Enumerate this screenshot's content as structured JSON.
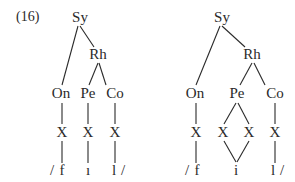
{
  "example_number": "(16)",
  "trees": [
    {
      "id": "left",
      "nodes": {
        "sy": {
          "label": "Sy",
          "x": 80,
          "y": 22
        },
        "rh": {
          "label": "Rh",
          "x": 98,
          "y": 59
        },
        "on": {
          "label": "On",
          "x": 61,
          "y": 98
        },
        "pe": {
          "label": "Pe",
          "x": 88,
          "y": 98
        },
        "co": {
          "label": "Co",
          "x": 115,
          "y": 98
        },
        "x1": {
          "label": "X",
          "x": 62,
          "y": 137
        },
        "x2": {
          "label": "X",
          "x": 88,
          "y": 137
        },
        "x3": {
          "label": "X",
          "x": 115,
          "y": 137
        }
      },
      "segments": {
        "open_slash": {
          "label": "/",
          "x": 52,
          "y": 175
        },
        "f": {
          "label": "f",
          "x": 62,
          "y": 175
        },
        "i": {
          "label": "ı",
          "x": 88,
          "y": 175
        },
        "l": {
          "label": "l",
          "x": 114,
          "y": 175
        },
        "close_slash": {
          "label": "/",
          "x": 123,
          "y": 175
        }
      }
    },
    {
      "id": "right",
      "nodes": {
        "sy": {
          "label": "Sy",
          "x": 222,
          "y": 22
        },
        "rh": {
          "label": "Rh",
          "x": 252,
          "y": 59
        },
        "on": {
          "label": "On",
          "x": 195,
          "y": 98
        },
        "pe": {
          "label": "Pe",
          "x": 237,
          "y": 98
        },
        "co": {
          "label": "Co",
          "x": 275,
          "y": 98
        },
        "x1": {
          "label": "X",
          "x": 196,
          "y": 137
        },
        "x2": {
          "label": "X",
          "x": 223,
          "y": 137
        },
        "x3": {
          "label": "X",
          "x": 249,
          "y": 137
        },
        "x4": {
          "label": "X",
          "x": 275,
          "y": 137
        }
      },
      "segments": {
        "open_slash": {
          "label": "/",
          "x": 187,
          "y": 175
        },
        "f": {
          "label": "f",
          "x": 197,
          "y": 175
        },
        "i": {
          "label": "i",
          "x": 236,
          "y": 175
        },
        "l": {
          "label": "l",
          "x": 273,
          "y": 175
        },
        "close_slash": {
          "label": "/",
          "x": 282,
          "y": 175
        }
      }
    }
  ]
}
